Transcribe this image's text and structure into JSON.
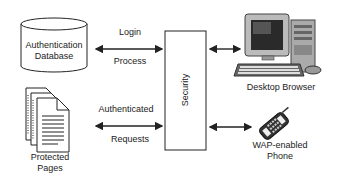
{
  "nodes": {
    "auth_db": {
      "line1": "Authentication",
      "line2": "Database"
    },
    "protected_pages": {
      "line1": "Protected",
      "line2": "Pages"
    },
    "security": {
      "label": "Security"
    },
    "desktop": {
      "label": "Desktop Browser"
    },
    "phone": {
      "line1": "WAP-enabled",
      "line2": "Phone"
    }
  },
  "edges": {
    "login": {
      "top": "Login",
      "bottom": "Process"
    },
    "requests": {
      "top": "Authenticated",
      "bottom": "Requests"
    }
  }
}
